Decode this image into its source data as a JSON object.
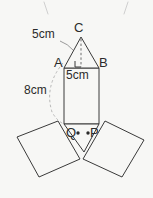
{
  "figure": {
    "background_color": "#f7f7f5",
    "stroke_color": "#3a3a3a",
    "leader_color": "#9a9a9a",
    "text_color": "#2b2b2b"
  },
  "vertices": {
    "C": "C",
    "A": "A",
    "B": "B",
    "Q": "Q",
    "P": "P"
  },
  "dimensions": {
    "slant": "5cm",
    "base": "5cm",
    "height": "8cm"
  },
  "marks": {
    "right_angle": "right-angle-mark",
    "point_Q": "point-marker",
    "point_P": "point-marker"
  },
  "shapes": {
    "top_triangle": "triangle-ABC",
    "center_rectangle": "rectangle-body",
    "left_flap": "left-tilted-rectangle",
    "right_flap": "right-tilted-rectangle",
    "bottom_triangle": "triangle-QP-apex"
  }
}
